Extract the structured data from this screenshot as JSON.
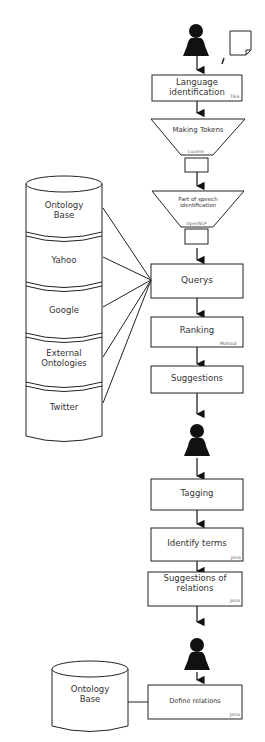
{
  "colors": {
    "stroke": "#222222",
    "fill": "#ffffff",
    "text": "#333333",
    "figure": "#111111"
  },
  "icons": {
    "user_top": "person-icon",
    "document": "document-icon",
    "user_middle": "person-icon",
    "user_bottom": "person-icon"
  },
  "flow": {
    "language_identification": {
      "label_line1": "Language",
      "label_line2": "identification",
      "tool": "Tika"
    },
    "making_tokens": {
      "label": "Making Tokens",
      "tool": "Lucene"
    },
    "pos_identification": {
      "label_line1": "Part of speech",
      "label_line2": "identification",
      "tool": "OpenNLP"
    },
    "querys": {
      "label": "Querys"
    },
    "ranking": {
      "label": "Ranking",
      "tool": "Mahout"
    },
    "suggestions": {
      "label": "Suggestions"
    },
    "tagging": {
      "label": "Tagging"
    },
    "identify_terms": {
      "label": "Identify terms",
      "tool": "Jena"
    },
    "suggestions_of_relations": {
      "label_line1": "Suggestions of",
      "label_line2": "relations",
      "tool": "Jena"
    },
    "define_relations": {
      "label": "Define relations",
      "tool": "Jena"
    }
  },
  "sources": [
    {
      "label_line1": "Ontology",
      "label_line2": "Base"
    },
    {
      "label_line1": "Yahoo",
      "label_line2": ""
    },
    {
      "label_line1": "Google",
      "label_line2": ""
    },
    {
      "label_line1": "External",
      "label_line2": "Ontologies"
    },
    {
      "label_line1": "Twitter",
      "label_line2": ""
    }
  ],
  "bottom_store": {
    "label_line1": "Ontology",
    "label_line2": "Base"
  }
}
